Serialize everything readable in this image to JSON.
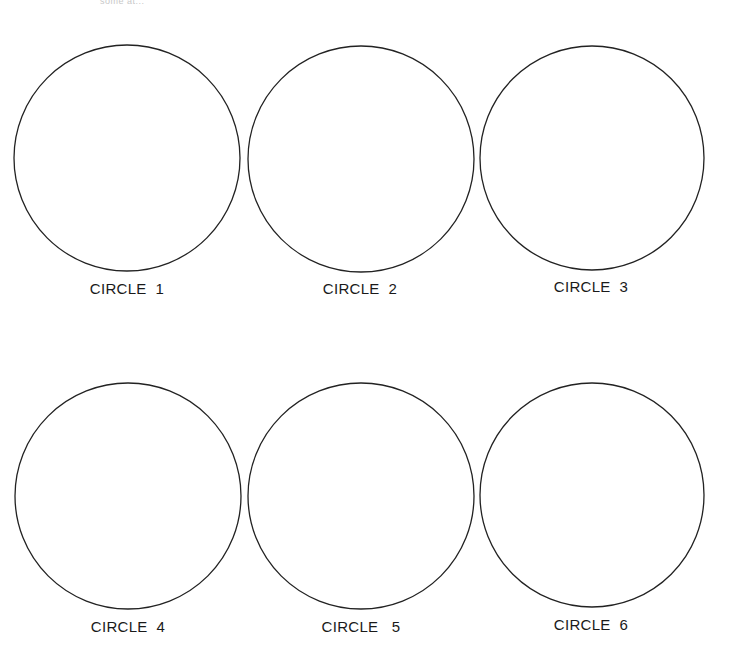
{
  "page": {
    "top_fragment": "some at..."
  },
  "circles": [
    {
      "label": "CIRCLE  1",
      "cx": 127,
      "cy": 158,
      "r": 113,
      "label_x": 127,
      "label_y": 256
    },
    {
      "label": "CIRCLE  2",
      "cx": 361,
      "cy": 159,
      "r": 113,
      "label_x": 360,
      "label_y": 256
    },
    {
      "label": "CIRCLE  3",
      "cx": 592,
      "cy": 158,
      "r": 112,
      "label_x": 591,
      "label_y": 254
    },
    {
      "label": "CIRCLE  4",
      "cx": 128,
      "cy": 496,
      "r": 113,
      "label_x": 128,
      "label_y": 594
    },
    {
      "label": "CIRCLE   5",
      "cx": 361,
      "cy": 496,
      "r": 113,
      "label_x": 361,
      "label_y": 594
    },
    {
      "label": "CIRCLE  6",
      "cx": 592,
      "cy": 495,
      "r": 112,
      "label_x": 591,
      "label_y": 592
    }
  ],
  "style": {
    "stroke_color": "#222222",
    "background": "#ffffff"
  }
}
